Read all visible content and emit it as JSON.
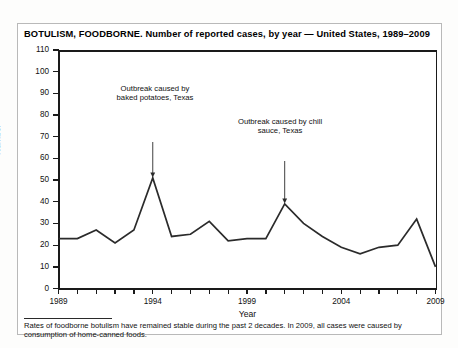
{
  "title": "BOTULISM, FOODBORNE. Number of reported cases, by year — United States, 1989–2009",
  "footnote": "Rates of foodborne botulism have remained stable during the past 2 decades. In 2009, all cases were caused by consumption of home-canned foods.",
  "colors": {
    "line": "#2b2b2b",
    "axis": "#1a1a1a",
    "text": "#111111",
    "frame": "#b9b9b9",
    "background": "#ffffff"
  },
  "annotations": [
    {
      "id": "baked-potatoes",
      "text": "Outbreak caused by baked potatoes, Texas",
      "year": 1994,
      "value": 51
    },
    {
      "id": "chili-sauce",
      "text": "Outbreak caused by chill sauce, Texas",
      "year": 2001,
      "value": 39
    }
  ],
  "chart_data": {
    "type": "line",
    "title": "BOTULISM, FOODBORNE. Number of reported cases, by year — United States, 1989–2009",
    "xlabel": "Year",
    "ylabel": "Number",
    "xlim": [
      1989,
      2009
    ],
    "ylim": [
      0,
      110
    ],
    "ytick_step": 10,
    "yticks": [
      0,
      10,
      20,
      30,
      40,
      50,
      60,
      70,
      80,
      90,
      100,
      110
    ],
    "xticks_labeled": [
      1989,
      1994,
      1999,
      2004,
      2009
    ],
    "xticks_all": [
      1989,
      1990,
      1991,
      1992,
      1993,
      1994,
      1995,
      1996,
      1997,
      1998,
      1999,
      2000,
      2001,
      2002,
      2003,
      2004,
      2005,
      2006,
      2007,
      2008,
      2009
    ],
    "grid": false,
    "legend": "none",
    "x": [
      1989,
      1990,
      1991,
      1992,
      1993,
      1994,
      1995,
      1996,
      1997,
      1998,
      1999,
      2000,
      2001,
      2002,
      2003,
      2004,
      2005,
      2006,
      2007,
      2008,
      2009
    ],
    "values": [
      23,
      23,
      27,
      21,
      27,
      51,
      24,
      25,
      31,
      22,
      23,
      23,
      39,
      30,
      24,
      19,
      16,
      19,
      20,
      32,
      10
    ],
    "annotations": [
      {
        "text": "Outbreak caused by baked potatoes, Texas",
        "x": 1994,
        "y": 51
      },
      {
        "text": "Outbreak caused by chill sauce, Texas",
        "x": 2001,
        "y": 39
      }
    ]
  }
}
